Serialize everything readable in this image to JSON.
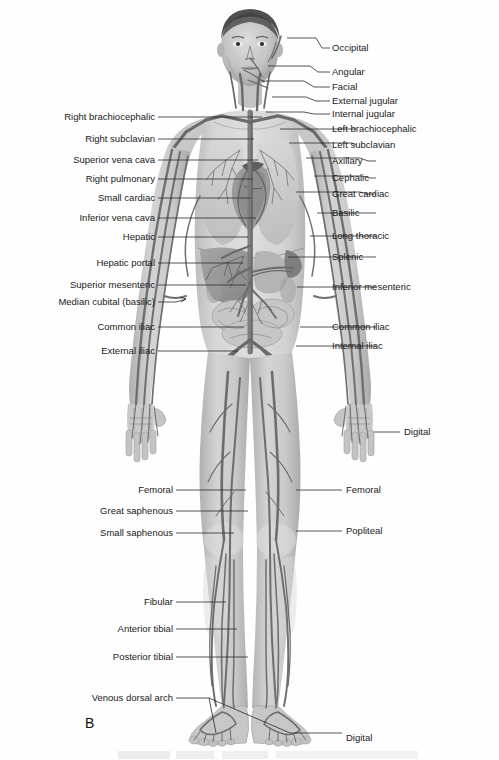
{
  "figure": {
    "panel_letter": "B",
    "title_visible": false,
    "body_region": "anterior full-body venous system"
  },
  "labels_left": [
    {
      "text": "Right brachiocephalic",
      "y": 117,
      "lead_to_x": 262,
      "lead_to_y": 117
    },
    {
      "text": "Right subclavian",
      "y": 139,
      "lead_to_x": 254,
      "lead_to_y": 139
    },
    {
      "text": "Superior vena cava",
      "y": 160,
      "lead_to_x": 258,
      "lead_to_y": 160
    },
    {
      "text": "Right pulmonary",
      "y": 179,
      "lead_to_x": 253,
      "lead_to_y": 179
    },
    {
      "text": "Small cardiac",
      "y": 198,
      "lead_to_x": 251,
      "lead_to_y": 198
    },
    {
      "text": "Inferior vena cava",
      "y": 218,
      "lead_to_x": 256,
      "lead_to_y": 218
    },
    {
      "text": "Hepatic",
      "y": 237,
      "lead_to_x": 248,
      "lead_to_y": 237
    },
    {
      "text": "Hepatic portal",
      "y": 263,
      "lead_to_x": 243,
      "lead_to_y": 263
    },
    {
      "text": "Superior mesenteric",
      "y": 285,
      "lead_to_x": 246,
      "lead_to_y": 285
    },
    {
      "text": "Median cubital (basilic)",
      "y": 302,
      "lead_to_x": 178,
      "lead_to_y": 299
    },
    {
      "text": "Common iliac",
      "y": 327,
      "lead_to_x": 244,
      "lead_to_y": 327
    },
    {
      "text": "External iliac",
      "y": 351,
      "lead_to_x": 238,
      "lead_to_y": 351
    }
  ],
  "labels_left_lower": [
    {
      "text": "Femoral",
      "y": 490,
      "lead_to_x": 246,
      "lead_to_y": 490
    },
    {
      "text": "Great saphenous",
      "y": 511,
      "lead_to_x": 248,
      "lead_to_y": 511
    },
    {
      "text": "Small saphenous",
      "y": 533,
      "lead_to_x": 234,
      "lead_to_y": 533
    },
    {
      "text": "Fibular",
      "y": 602,
      "lead_to_x": 226,
      "lead_to_y": 602
    },
    {
      "text": "Anterior tibial",
      "y": 629,
      "lead_to_x": 237,
      "lead_to_y": 629
    },
    {
      "text": "Posterior tibial",
      "y": 657,
      "lead_to_x": 248,
      "lead_to_y": 657
    },
    {
      "text": "Venous dorsal arch",
      "y": 698,
      "lead_to_x": 209,
      "lead_to_y": 698
    }
  ],
  "labels_right": [
    {
      "text": "Occipital",
      "y": 48,
      "lead_from_x": 287,
      "lead_from_y": 38
    },
    {
      "text": "Angular",
      "y": 72,
      "lead_from_x": 268,
      "lead_from_y": 66
    },
    {
      "text": "Facial",
      "y": 87,
      "lead_from_x": 262,
      "lead_from_y": 81
    },
    {
      "text": "External jugular",
      "y": 101,
      "lead_from_x": 272,
      "lead_from_y": 97
    },
    {
      "text": "Internal jugular",
      "y": 114,
      "lead_from_x": 266,
      "lead_from_y": 112
    },
    {
      "text": "Left brachiocephalic",
      "y": 129,
      "lead_from_x": 280,
      "lead_from_y": 129
    },
    {
      "text": "Left subclavian",
      "y": 145,
      "lead_from_x": 289,
      "lead_from_y": 143
    },
    {
      "text": "Axillary",
      "y": 161,
      "lead_from_x": 306,
      "lead_from_y": 158
    },
    {
      "text": "Cephalic",
      "y": 178,
      "lead_from_x": 314,
      "lead_from_y": 176
    },
    {
      "text": "Great cardiac",
      "y": 194,
      "lead_from_x": 296,
      "lead_from_y": 192
    },
    {
      "text": "Basilic",
      "y": 213,
      "lead_from_x": 317,
      "lead_from_y": 213
    },
    {
      "text": "Long thoracic",
      "y": 236,
      "lead_from_x": 310,
      "lead_from_y": 236
    },
    {
      "text": "Splenic",
      "y": 257,
      "lead_from_x": 288,
      "lead_from_y": 257
    },
    {
      "text": "Inferior mesenteric",
      "y": 287,
      "lead_from_x": 297,
      "lead_from_y": 287
    },
    {
      "text": "Common iliac",
      "y": 327,
      "lead_from_x": 300,
      "lead_from_y": 327
    },
    {
      "text": "Internal iliac",
      "y": 346,
      "lead_from_x": 296,
      "lead_from_y": 346
    }
  ],
  "labels_right_lower": [
    {
      "text": "Digital",
      "y": 432,
      "lead_from_x": 374,
      "lead_from_y": 432
    },
    {
      "text": "Femoral",
      "y": 490,
      "lead_from_x": 296,
      "lead_from_y": 490
    },
    {
      "text": "Popliteal",
      "y": 531,
      "lead_from_x": 296,
      "lead_from_y": 531
    },
    {
      "text": "Digital",
      "y": 738,
      "lead_from_x": 290,
      "lead_from_y": 733
    }
  ],
  "colors": {
    "background": "#ffffff",
    "label_text": "#1a1a1a",
    "leader_line": "#2b2b2b",
    "skin_light": "#d9d9d9",
    "skin_mid": "#c2c2c2",
    "skin_dark": "#a8a8a8",
    "vessel_dark": "#6d6d6d",
    "vessel_mid": "#848484",
    "organ_dark": "#8f8f8f",
    "organ_light": "#cfcfcf",
    "hair": "#4a4a4a"
  }
}
